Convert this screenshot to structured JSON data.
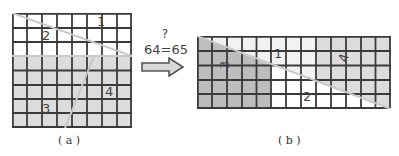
{
  "figure_a": {
    "caption": "( a )",
    "grid": {
      "cols": 8,
      "rows": 8
    },
    "pieces": [
      {
        "id": "1",
        "label": "1",
        "fill": "#ffffff"
      },
      {
        "id": "2",
        "label": "2",
        "fill": "#ffffff"
      },
      {
        "id": "3",
        "label": "3",
        "fill": "#dcdcdc"
      },
      {
        "id": "4",
        "label": "4",
        "fill": "#dcdcdc"
      }
    ]
  },
  "figure_b": {
    "caption": "( b )",
    "grid": {
      "cols": 13,
      "rows": 5
    },
    "pieces": [
      {
        "id": "1",
        "label": "1",
        "fill": "#f2f2f2"
      },
      {
        "id": "2",
        "label": "2",
        "fill": "#ffffff"
      },
      {
        "id": "3",
        "label": "3",
        "fill": "#bdbdbd"
      },
      {
        "id": "4",
        "label": "4",
        "fill": "#dcdcdc"
      }
    ]
  },
  "transition": {
    "question_mark": "?",
    "equation": "64=65",
    "arrow": "right-arrow"
  },
  "colors": {
    "grid_line": "#3a3a3a",
    "cut_line": "#c8c8c8",
    "label": "#444444"
  }
}
